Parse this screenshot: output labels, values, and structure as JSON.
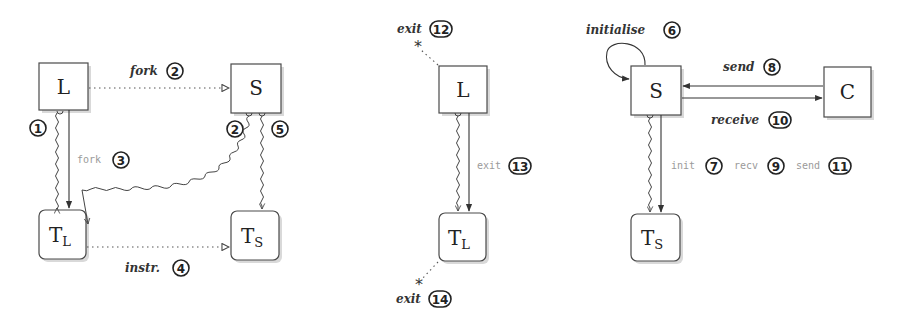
{
  "diagrams": [
    {
      "id": "left",
      "nodes": [
        {
          "key": "L",
          "label": "L",
          "sub": ""
        },
        {
          "key": "S",
          "label": "S",
          "sub": ""
        },
        {
          "key": "TL",
          "label": "T",
          "sub": "L"
        },
        {
          "key": "TS",
          "label": "T",
          "sub": "S"
        }
      ],
      "edges": [
        {
          "label": "fork",
          "num": "2",
          "style": "dotted",
          "from": "L",
          "to": "S"
        },
        {
          "label": "",
          "num": "1",
          "style": "wavy",
          "from": "L",
          "to": "TL"
        },
        {
          "label": "fork",
          "num": "3",
          "style": "solid-mono",
          "from": "L",
          "to": "TL"
        },
        {
          "label": "",
          "num": "2",
          "style": "wavy",
          "from": "S",
          "to": "TL"
        },
        {
          "label": "",
          "num": "5",
          "style": "wavy",
          "from": "S",
          "to": "TS"
        },
        {
          "label": "instr.",
          "num": "4",
          "style": "dotted",
          "from": "TL",
          "to": "TS"
        }
      ]
    },
    {
      "id": "middle",
      "nodes": [
        {
          "key": "L",
          "label": "L",
          "sub": ""
        },
        {
          "key": "TL",
          "label": "T",
          "sub": "L"
        }
      ],
      "edges": [
        {
          "label": "exit",
          "num": "12",
          "style": "dotted",
          "from": "L",
          "to": "*"
        },
        {
          "label": "exit",
          "num": "13",
          "style": "solid-mono",
          "from": "L",
          "to": "TL"
        },
        {
          "label": "exit",
          "num": "14",
          "style": "dotted",
          "from": "TL",
          "to": "*"
        }
      ]
    },
    {
      "id": "right",
      "nodes": [
        {
          "key": "S",
          "label": "S",
          "sub": ""
        },
        {
          "key": "C",
          "label": "C",
          "sub": ""
        },
        {
          "key": "TS",
          "label": "T",
          "sub": "S"
        }
      ],
      "edges": [
        {
          "label": "initialise",
          "num": "6",
          "style": "solid",
          "from": "S",
          "to": "S"
        },
        {
          "label": "send",
          "num": "8",
          "style": "solid",
          "from": "C",
          "to": "S"
        },
        {
          "label": "receive",
          "num": "10",
          "style": "solid",
          "from": "S",
          "to": "C"
        },
        {
          "label": "init",
          "num": "7",
          "style": "solid-mono",
          "from": "S",
          "to": "TS"
        },
        {
          "label": "recv",
          "num": "9",
          "style": "solid-mono",
          "from": "S",
          "to": "TS"
        },
        {
          "label": "send",
          "num": "11",
          "style": "solid-mono",
          "from": "S",
          "to": "TS"
        }
      ]
    }
  ]
}
